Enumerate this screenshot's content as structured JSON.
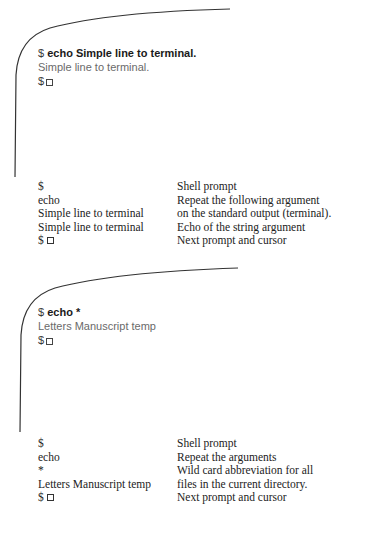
{
  "figure1": {
    "terminal": {
      "prompt": "$",
      "command": "echo Simple line to terminal.",
      "output": "Simple line to terminal.",
      "next_prompt": "$"
    },
    "explanation": [
      {
        "term": "$",
        "desc": "Shell prompt"
      },
      {
        "term": "echo",
        "desc": "Repeat the following argument"
      },
      {
        "term": "Simple line to terminal",
        "desc": "on the standard output (terminal)."
      },
      {
        "term": "Simple line to terminal",
        "desc": "Echo of the string argument"
      },
      {
        "term": "$",
        "desc": "Next prompt and cursor"
      }
    ]
  },
  "figure2": {
    "terminal": {
      "prompt": "$",
      "command": "echo *",
      "output": "Letters Manuscript temp",
      "next_prompt": "$"
    },
    "explanation": [
      {
        "term": "$",
        "desc": "Shell prompt"
      },
      {
        "term": "echo",
        "desc": "Repeat the arguments"
      },
      {
        "term": "*",
        "desc": "Wild card abbreviation for all"
      },
      {
        "term": "Letters Manuscript temp",
        "desc": "files in the current directory."
      },
      {
        "term": "$",
        "desc": "Next prompt and cursor"
      }
    ]
  },
  "colors": {
    "frame_line": "#333333",
    "command_text": "#1a1a1a",
    "output_text": "#6a6a6a",
    "table_text": "#222222"
  }
}
